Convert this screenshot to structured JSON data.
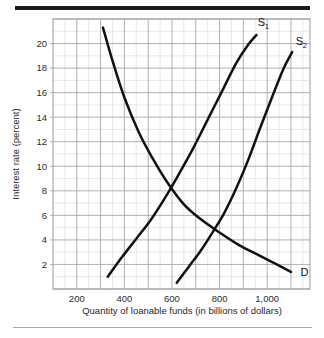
{
  "chart_data": {
    "type": "line",
    "title": "",
    "subtitle": "",
    "xlabel": "Quantity of loanable funds (in billions of dollars)",
    "ylabel": "Interest rate (percent)",
    "xlim": [
      100,
      1180
    ],
    "ylim": [
      0,
      22
    ],
    "grid": true,
    "grid_minor": true,
    "legend_position": "inline-end-of-curve",
    "xticks": [
      200,
      400,
      600,
      800,
      1000
    ],
    "xtick_labels": [
      "200",
      "400",
      "600",
      "800",
      "1,000"
    ],
    "yticks": [
      2,
      4,
      6,
      8,
      10,
      12,
      14,
      16,
      18,
      20
    ],
    "ytick_labels": [
      "2",
      "4",
      "6",
      "8",
      "10",
      "12",
      "14",
      "16",
      "18",
      "20"
    ],
    "annotations": [
      {
        "name": "demand-curve-label",
        "text": "D",
        "sub": "",
        "x": 1140,
        "y": 1.1
      },
      {
        "name": "supply-1-curve-label",
        "text": "S",
        "sub": "1",
        "x": 960,
        "y": 21.4
      },
      {
        "name": "supply-2-curve-label",
        "text": "S",
        "sub": "2",
        "x": 1120,
        "y": 19.9
      }
    ],
    "series": [
      {
        "name": "D",
        "label": "D",
        "description": "Demand for loanable funds (downward sloping)",
        "color": "#111111",
        "x": [
          310,
          350,
          400,
          460,
          520,
          580,
          650,
          720,
          800,
          880,
          960,
          1030,
          1100
        ],
        "y": [
          21.3,
          18.6,
          15.6,
          12.8,
          10.6,
          8.7,
          6.9,
          5.7,
          4.6,
          3.6,
          2.8,
          2.1,
          1.4
        ]
      },
      {
        "name": "S1",
        "label": "S1",
        "description": "Original supply of loanable funds (upward sloping)",
        "color": "#111111",
        "x": [
          330,
          390,
          450,
          510,
          570,
          630,
          690,
          750,
          810,
          870,
          920,
          955
        ],
        "y": [
          1.0,
          2.6,
          4.1,
          5.6,
          7.4,
          9.4,
          11.5,
          13.8,
          16.1,
          18.4,
          19.9,
          20.7
        ]
      },
      {
        "name": "S2",
        "label": "S2",
        "description": "Increased supply of loanable funds (shifted right)",
        "color": "#111111",
        "x": [
          620,
          670,
          720,
          770,
          820,
          870,
          920,
          970,
          1020,
          1070,
          1105
        ],
        "y": [
          0.5,
          1.8,
          3.1,
          4.6,
          6.2,
          8.2,
          10.5,
          13.1,
          15.6,
          18.0,
          19.3
        ]
      }
    ],
    "equilibria": [
      {
        "name": "equilibrium-original",
        "curves": [
          "D",
          "S1"
        ],
        "quantity": 650,
        "rate": 6
      },
      {
        "name": "equilibrium-new",
        "curves": [
          "D",
          "S2"
        ],
        "quantity": 790,
        "rate": 4
      }
    ],
    "colors": {
      "curve": "#111111",
      "grid_major": "#a6a8ad",
      "grid_minor": "#dcdee1",
      "plot_border": "#9a9ca1",
      "text": "#1f1f1f",
      "top_rule": "#1b1b1b",
      "bottom_rule": "#a9a9a9"
    }
  }
}
